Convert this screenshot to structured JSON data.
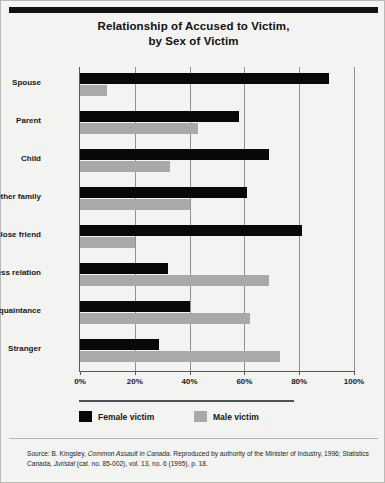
{
  "figure": {
    "title_line1": "Relationship of Accused to Victim,",
    "title_line2": "by Sex of Victim"
  },
  "legend": {
    "female_label": "Female victim",
    "male_label": "Male victim",
    "female_color": "#080808",
    "male_color": "#a9a9a9",
    "position": "below-axis-left"
  },
  "source": {
    "prefix": "Source: B. Kingsley, ",
    "title1": "Common Assault in Canada",
    "middle": ". Reproduced by authority of the Minister of Industry, 1996; Statistics Canada, ",
    "title2": "Juristat",
    "suffix": " (cat. no. 85-002), vol. 13, no. 6 (1995), p. 18."
  },
  "chart_data": {
    "type": "bar",
    "orientation": "horizontal",
    "title": "Relationship of Accused to Victim, by Sex of Victim",
    "xlabel": "",
    "ylabel": "",
    "categories": [
      "Spouse",
      "Parent",
      "Child",
      "Other family",
      "Close friend",
      "Business relation",
      "Acquaintance",
      "Stranger"
    ],
    "series": [
      {
        "name": "Female victim",
        "color": "#080808",
        "values": [
          91,
          58,
          69,
          61,
          81,
          32,
          40,
          29
        ]
      },
      {
        "name": "Male victim",
        "color": "#a9a9a9",
        "values": [
          10,
          43,
          33,
          40,
          20,
          69,
          62,
          73
        ]
      }
    ],
    "xlim": [
      0,
      100
    ],
    "xticks": [
      0,
      20,
      40,
      60,
      80,
      100
    ],
    "xtick_labels": [
      "0%",
      "20%",
      "40%",
      "60%",
      "80%",
      "100%"
    ],
    "grid": true,
    "grid_axis": "x",
    "legend_position": "bottom-left",
    "value_unit": "percent"
  }
}
